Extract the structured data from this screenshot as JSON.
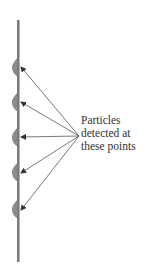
{
  "diagram": {
    "annotation": {
      "lines": [
        "Particles",
        "detected at",
        "these points"
      ]
    },
    "screen": {
      "x": 18,
      "y_top": 20,
      "y_bottom": 262,
      "color": "#7a7a7a"
    },
    "convergence_point": {
      "x": 79,
      "y": 136
    },
    "detection_points": [
      {
        "y": 67
      },
      {
        "y": 102
      },
      {
        "y": 137
      },
      {
        "y": 172
      },
      {
        "y": 209
      }
    ],
    "colors": {
      "line": "#555555",
      "bump": "#8c8c8c",
      "text": "#333333"
    }
  }
}
